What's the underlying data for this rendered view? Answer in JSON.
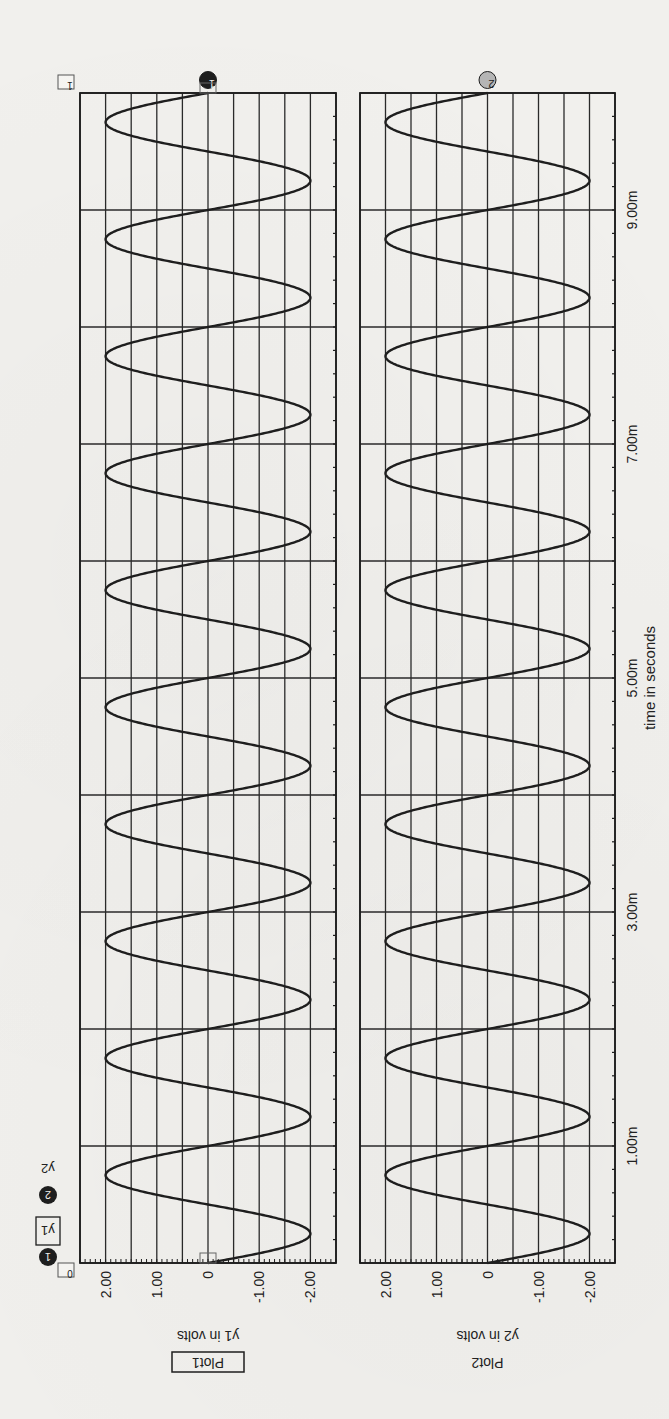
{
  "chart_data": {
    "type": "line",
    "orientation_note_visible": "figure printed rotated 90 degrees",
    "xlabel": "time in seconds",
    "x_range_ms": [
      0,
      10
    ],
    "x_tick_labels": [
      "1.00m",
      "3.00m",
      "5.00m",
      "7.00m",
      "9.00m"
    ],
    "x_tick_values_ms": [
      1,
      3,
      5,
      7,
      9
    ],
    "x_major_grid_ms": 1,
    "x_minor_tick_ms": 0.2,
    "legend": [
      {
        "marker": "1",
        "label": "y1"
      },
      {
        "marker": "2",
        "label": "y2"
      }
    ],
    "cursors": {
      "left": "0",
      "right": "1"
    },
    "plots": [
      {
        "name": "Plot1",
        "ylabel": "y1 in volts",
        "ylim": [
          -2.5,
          2.5
        ],
        "y_tick_labels": [
          "2.00",
          "1.00",
          "0",
          "-1.00",
          "-2.00"
        ],
        "y_tick_values": [
          2,
          1,
          0,
          -1,
          -2
        ],
        "y_grid_step": 0.5,
        "series": {
          "name": "y1",
          "marker": "1",
          "shape": "sine",
          "amplitude_v": 2.0,
          "frequency_hz": 1000,
          "phase": "starts at 0 going negative",
          "x_ms": [
            0,
            0.25,
            0.5,
            0.75,
            1.0,
            1.25,
            1.5,
            1.75,
            2.0,
            2.25,
            2.5,
            2.75,
            3.0,
            3.25,
            3.5,
            3.75,
            4.0,
            4.25,
            4.5,
            4.75,
            5.0,
            5.25,
            5.5,
            5.75,
            6.0,
            6.25,
            6.5,
            6.75,
            7.0,
            7.25,
            7.5,
            7.75,
            8.0,
            8.25,
            8.5,
            8.75,
            9.0,
            9.25,
            9.5,
            9.75,
            10.0
          ],
          "y_v": [
            0,
            -2,
            0,
            2,
            0,
            -2,
            0,
            2,
            0,
            -2,
            0,
            2,
            0,
            -2,
            0,
            2,
            0,
            -2,
            0,
            2,
            0,
            -2,
            0,
            2,
            0,
            -2,
            0,
            2,
            0,
            -2,
            0,
            2,
            0,
            -2,
            0,
            2,
            0,
            -2,
            0,
            2,
            0
          ]
        }
      },
      {
        "name": "Plot2",
        "ylabel": "y2 in volts",
        "ylim": [
          -2.5,
          2.5
        ],
        "y_tick_labels": [
          "2.00",
          "1.00",
          "0",
          "-1.00",
          "-2.00"
        ],
        "y_tick_values": [
          2,
          1,
          0,
          -1,
          -2
        ],
        "y_grid_step": 0.5,
        "series": {
          "name": "y2",
          "marker": "2",
          "shape": "sine",
          "amplitude_v": 2.0,
          "frequency_hz": 1000,
          "phase": "starts at 0 going negative",
          "x_ms": [
            0,
            0.25,
            0.5,
            0.75,
            1.0,
            1.25,
            1.5,
            1.75,
            2.0,
            2.25,
            2.5,
            2.75,
            3.0,
            3.25,
            3.5,
            3.75,
            4.0,
            4.25,
            4.5,
            4.75,
            5.0,
            5.25,
            5.5,
            5.75,
            6.0,
            6.25,
            6.5,
            6.75,
            7.0,
            7.25,
            7.5,
            7.75,
            8.0,
            8.25,
            8.5,
            8.75,
            9.0,
            9.25,
            9.5,
            9.75,
            10.0
          ],
          "y_v": [
            0,
            -2,
            0,
            2,
            0,
            -2,
            0,
            2,
            0,
            -2,
            0,
            2,
            0,
            -2,
            0,
            2,
            0,
            -2,
            0,
            2,
            0,
            -2,
            0,
            2,
            0,
            -2,
            0,
            2,
            0,
            -2,
            0,
            2,
            0,
            -2,
            0,
            2,
            0,
            -2,
            0,
            2,
            0
          ]
        }
      }
    ]
  },
  "colors": {
    "paper": "#f1f0ed",
    "ink": "#1e1e1e",
    "grid": "#2a2a2a",
    "marker2_fill": "#b5b5b5"
  }
}
